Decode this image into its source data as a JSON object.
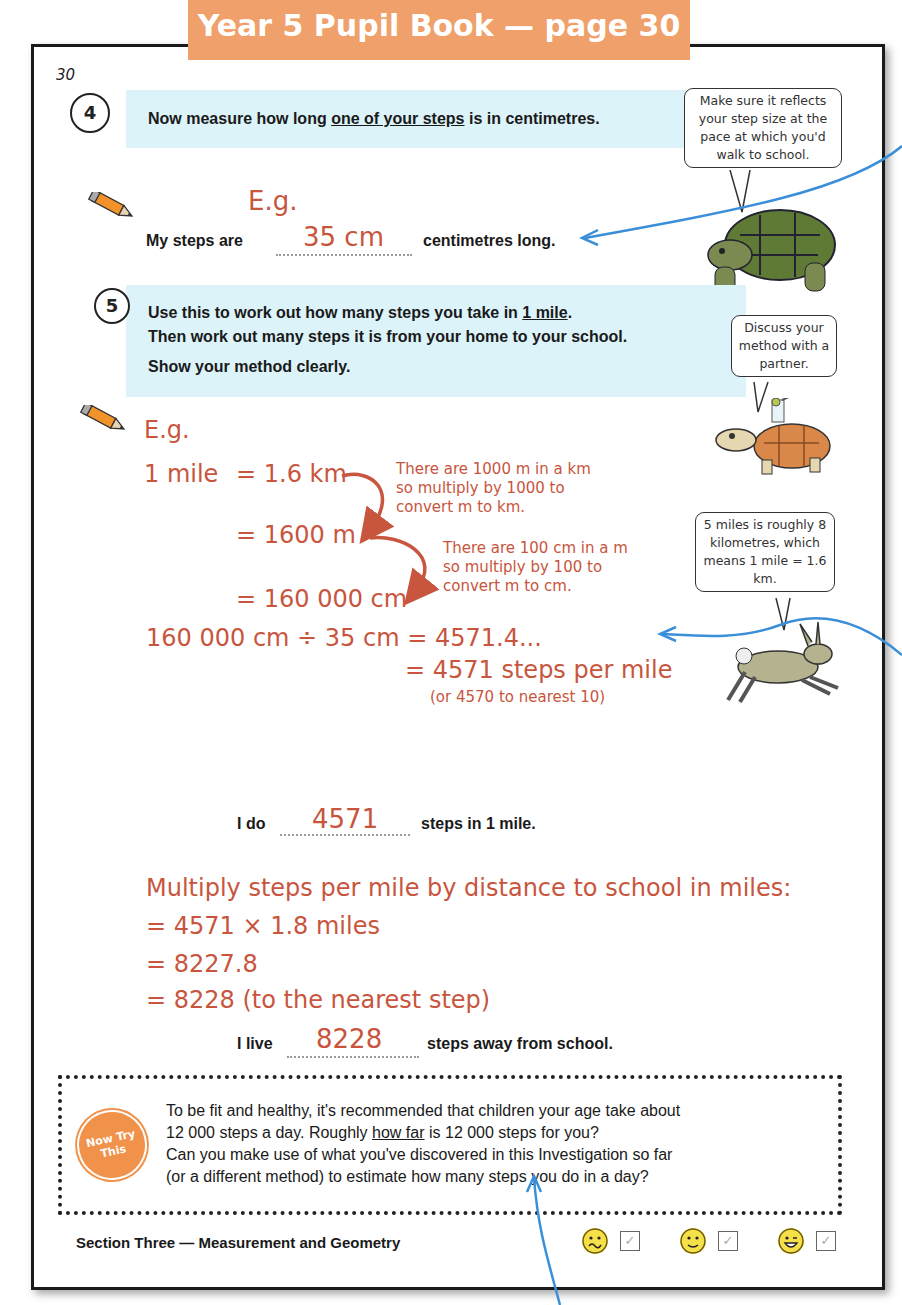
{
  "header": {
    "title": "Year 5 Pupil Book — page 30",
    "background_color": "#f0a06a"
  },
  "page": {
    "number": "30"
  },
  "question4": {
    "number": "4",
    "text_before": "Now measure how long ",
    "text_underlined": "one of your steps",
    "text_after": " is in centimetres.",
    "example_label": "E.g.",
    "answer_prefix": "My steps are",
    "answer_value": "35 cm",
    "answer_suffix": "centimetres long.",
    "tip_bubble": "Make sure it reflects your step size at the pace at which you'd walk to school."
  },
  "question5": {
    "number": "5",
    "line1_before": "Use this to work out how many steps you take in ",
    "line1_underlined": "1 mile",
    "line1_after": ".",
    "line2": "Then work out many steps it is from your home to your school.",
    "line3": "Show your method clearly.",
    "tip_bubble": "Discuss your method with a partner.",
    "example_label": "E.g.",
    "working": {
      "line1_left": "1 mile",
      "line1_right": "= 1.6 km",
      "line2": "= 1600 m",
      "line3": "= 160 000 cm",
      "note1": [
        "There are 1000 m in a km",
        "so multiply by 1000 to",
        "convert m to km."
      ],
      "note2": [
        "There are 100 cm in a m",
        "so multiply by 100 to",
        "convert m to cm."
      ],
      "division": "160 000 cm ÷ 35 cm = 4571.4...",
      "result": "= 4571 steps per mile",
      "rounding": "(or 4570 to nearest 10)"
    },
    "hare_bubble": "5 miles is roughly 8 kilometres, which means 1 mile = 1.6 km.",
    "answer1_prefix": "I do",
    "answer1_value": "4571",
    "answer1_suffix": "steps in 1 mile.",
    "school_working": [
      "Multiply steps per mile by distance to school in miles:",
      "= 4571 × 1.8 miles",
      "= 8227.8",
      "= 8228 (to the nearest step)"
    ],
    "answer2_prefix": "I live",
    "answer2_value": "8228",
    "answer2_suffix": "steps away from school."
  },
  "now_try_this": {
    "badge_line1": "Now Try",
    "badge_line2": "This",
    "line1": "To be fit and healthy, it's recommended that children your age take about",
    "line2_before": "12 000 steps a day.  Roughly ",
    "line2_underlined": "how far",
    "line2_after": " is 12 000 steps for you?",
    "line3": "Can you make use of what you've discovered in this Investigation so far",
    "line4": "(or a different method) to estimate how many steps you do in a day?",
    "badge_color": "#f0924a"
  },
  "footer": {
    "section": "Section Three — Measurement and Geometry",
    "check_mark": "✓"
  },
  "colors": {
    "answer_red": "#c8553d",
    "question_bg": "#dcf3f9",
    "arrow_blue": "#3a8fd8"
  }
}
